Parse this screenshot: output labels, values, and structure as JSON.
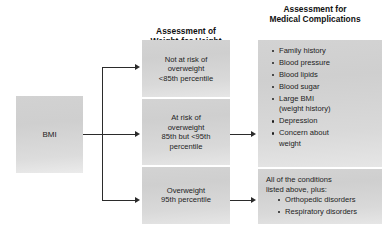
{
  "figure": {
    "type": "flowchart",
    "orientation": "left-to-right",
    "columns": 3
  },
  "headings": {
    "middle": "Assessment of\nWeight-for-Height",
    "middle_line1": "Assessment of",
    "middle_line2": "Weight-for-Height",
    "right_line1": "Assessment for",
    "right_line2": "Medical Complications"
  },
  "source_box": {
    "label": "BMI"
  },
  "weight_categories": [
    {
      "id": "not-at-risk",
      "lines": [
        "Not at risk of",
        "overweight",
        "<85th percentile"
      ],
      "has_complication_arrow": false
    },
    {
      "id": "at-risk",
      "lines": [
        "At risk of",
        "overweight",
        "85th but <95th",
        "percentile"
      ],
      "has_complication_arrow": true
    },
    {
      "id": "overweight",
      "lines": [
        "Overweight",
        "95th percentile"
      ],
      "has_complication_arrow": true
    }
  ],
  "complications_primary": {
    "items": [
      "Family history",
      "Blood pressure",
      "Blood lipids",
      "Blood sugar",
      "Large  BMI",
      "(weight history)",
      "Depression",
      "Concern about",
      "weight"
    ],
    "bulleted": [
      {
        "text": "Family history",
        "bullet": true
      },
      {
        "text": "Blood pressure",
        "bullet": true
      },
      {
        "text": "Blood lipids",
        "bullet": true
      },
      {
        "text": "Blood sugar",
        "bullet": true
      },
      {
        "text": "Large  BMI",
        "bullet": true
      },
      {
        "text": "(weight history)",
        "bullet": false
      },
      {
        "text": "Depression",
        "bullet": true
      },
      {
        "text": "Concern about",
        "bullet": true
      },
      {
        "text": "weight",
        "bullet": false
      }
    ]
  },
  "complications_secondary": {
    "lead_line1": "All of the conditions",
    "lead_line2": "listed above, plus:",
    "items": [
      "Orthopedic disorders",
      "Respiratory disorders"
    ]
  },
  "colors": {
    "background": "#ffffff",
    "box_fill_light": "#e6e6e6",
    "box_fill_dark": "#cfcfcf",
    "text": "#1d1d1d",
    "connector": "#2b2b2b"
  }
}
